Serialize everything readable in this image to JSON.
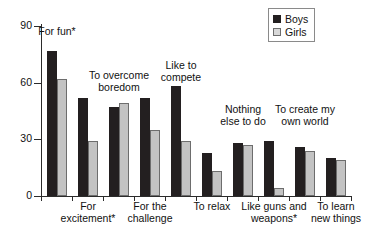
{
  "chart_data": {
    "type": "bar",
    "title": "",
    "subtitle": "",
    "xlabel": "",
    "ylabel": "",
    "ylim": [
      0,
      90
    ],
    "yticks": [
      0,
      30,
      60,
      90
    ],
    "grid": false,
    "legend_position": "top-right",
    "categories": [
      "For fun*",
      "For\nexcitement*",
      "To overcome\nboredom",
      "For the\nchallenge",
      "Like to\ncompete",
      "To relax",
      "Nothing\nelse to do",
      "Like guns and\nweapons*",
      "To create my\nown world",
      "To learn\nnew things"
    ],
    "series": [
      {
        "name": "Boys",
        "color": "#231f20",
        "values": [
          77,
          52,
          47,
          52,
          58,
          23,
          28,
          29,
          26,
          20
        ]
      },
      {
        "name": "Girls",
        "color": "#c3c3c3",
        "values": [
          62,
          29,
          49,
          35,
          29,
          13,
          27,
          4,
          24,
          19
        ]
      }
    ],
    "annotations": [
      {
        "text": "For fun*",
        "placement": "above-group-1"
      },
      {
        "text": "To overcome\nboredom",
        "placement": "above-group-3"
      },
      {
        "text": "Like to\ncompete",
        "placement": "above-group-5"
      },
      {
        "text": "Nothing\nelse to do",
        "placement": "above-group-7"
      },
      {
        "text": "To create my\nown world",
        "placement": "above-group-9"
      }
    ]
  },
  "axis": {
    "y_tick_labels": [
      "90",
      "60",
      "30",
      "0"
    ]
  },
  "legend": {
    "items": [
      {
        "label": "Boys",
        "swatch": "boys-swatch"
      },
      {
        "label": "Girls",
        "swatch": "girls-swatch"
      }
    ]
  },
  "labels": {
    "in_plot": [
      {
        "text": "For fun*"
      },
      {
        "text": "To overcome\nboredom"
      },
      {
        "text": "Like to\ncompete"
      },
      {
        "text": "Nothing\nelse to do"
      },
      {
        "text": "To create my\nown world"
      }
    ],
    "below_axis": [
      {
        "text": "For\nexcitement*"
      },
      {
        "text": "For the\nchallenge"
      },
      {
        "text": "To relax"
      },
      {
        "text": "Like guns and\nweapons*"
      },
      {
        "text": "To learn\nnew things"
      }
    ]
  }
}
